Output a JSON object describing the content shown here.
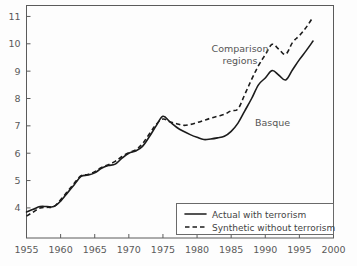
{
  "chart_data": {
    "type": "line",
    "title": "",
    "xlabel": "",
    "ylabel": "",
    "xlim": [
      1955,
      2000
    ],
    "ylim": [
      2.9,
      11.4
    ],
    "grid": false,
    "legend_position": "bottom-right",
    "xticks": [
      "1955",
      "1960",
      "1965",
      "1970",
      "1975",
      "1980",
      "1985",
      "1990",
      "1995",
      "2000"
    ],
    "yticks": [
      "4",
      "5",
      "6",
      "7",
      "8",
      "9",
      "10",
      "11"
    ],
    "x": [
      1955,
      1956,
      1957,
      1958,
      1959,
      1960,
      1961,
      1962,
      1963,
      1964,
      1965,
      1966,
      1967,
      1968,
      1969,
      1970,
      1971,
      1972,
      1973,
      1974,
      1975,
      1976,
      1977,
      1978,
      1979,
      1980,
      1981,
      1982,
      1983,
      1984,
      1985,
      1986,
      1987,
      1988,
      1989,
      1990,
      1991,
      1992,
      1993,
      1994,
      1995,
      1996,
      1997
    ],
    "series": [
      {
        "name": "Actual with terrorism",
        "style": "solid",
        "label": "Basque",
        "values": [
          3.85,
          3.95,
          4.05,
          4.05,
          4.05,
          4.25,
          4.55,
          4.85,
          5.15,
          5.2,
          5.28,
          5.45,
          5.55,
          5.6,
          5.82,
          6.0,
          6.08,
          6.25,
          6.6,
          7.0,
          7.35,
          7.15,
          6.95,
          6.8,
          6.68,
          6.58,
          6.5,
          6.52,
          6.56,
          6.62,
          6.8,
          7.1,
          7.55,
          8.0,
          8.5,
          8.75,
          9.02,
          8.85,
          8.68,
          9.05,
          9.42,
          9.75,
          10.1
        ]
      },
      {
        "name": "Synthetic without terrorism",
        "style": "dashed",
        "label": "Comparison regions",
        "values": [
          3.7,
          3.85,
          4.0,
          4.02,
          4.05,
          4.3,
          4.6,
          4.9,
          5.18,
          5.22,
          5.32,
          5.48,
          5.58,
          5.7,
          5.88,
          6.02,
          6.12,
          6.35,
          6.7,
          7.05,
          7.25,
          7.15,
          7.08,
          7.02,
          7.05,
          7.12,
          7.2,
          7.28,
          7.35,
          7.42,
          7.55,
          7.62,
          8.15,
          8.7,
          9.2,
          9.6,
          9.98,
          9.8,
          9.62,
          10.05,
          10.3,
          10.6,
          10.98
        ]
      }
    ],
    "annotations": [
      {
        "name": "comparison-regions",
        "lines": [
          "Comparison",
          "regions"
        ]
      },
      {
        "name": "basque",
        "lines": [
          "Basque"
        ]
      }
    ]
  },
  "legend": {
    "items": [
      {
        "label": "Actual with terrorism",
        "style": "solid"
      },
      {
        "label": "Synthetic without terrorism",
        "style": "dashed"
      }
    ]
  }
}
